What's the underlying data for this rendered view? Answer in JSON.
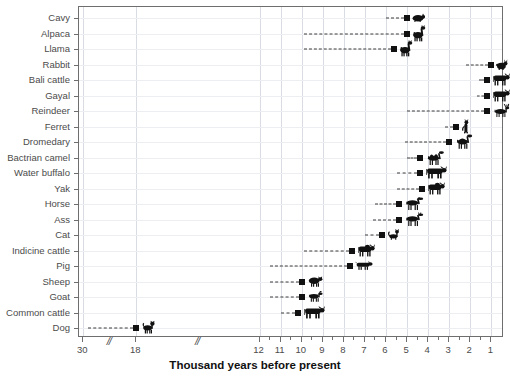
{
  "chart_data": {
    "type": "scatter",
    "title": "",
    "xlabel": "Thousand years before present",
    "ylabel": "",
    "grid": true,
    "legend": "none",
    "orientation": "horizontal",
    "marker": "square",
    "leader_line": "dashed",
    "axis_breaks": [
      "between 30 and 18",
      "between 18 and 12"
    ],
    "xticks": [
      30,
      18,
      12,
      11,
      10,
      9,
      8,
      7,
      6,
      5,
      4,
      3,
      2,
      1
    ],
    "xtick_labels": [
      "30",
      "18",
      "12",
      "11",
      "10",
      "9",
      "8",
      "7",
      "6",
      "5",
      "4",
      "3",
      "2",
      "1"
    ],
    "xlim": [
      30,
      0.6
    ],
    "categories": [
      "Cavy",
      "Alpaca",
      "Llama",
      "Rabbit",
      "Bali cattle",
      "Gayal",
      "Reindeer",
      "Ferret",
      "Dromedary",
      "Bactrian camel",
      "Water buffalo",
      "Yak",
      "Horse",
      "Ass",
      "Cat",
      "Indicine cattle",
      "Pig",
      "Sheep",
      "Goat",
      "Common cattle",
      "Dog"
    ],
    "points": [
      {
        "label": "Cavy",
        "value": 5.0,
        "icon": "cavy-silhouette"
      },
      {
        "label": "Alpaca",
        "value": 5.0,
        "icon": "alpaca-silhouette"
      },
      {
        "label": "Llama",
        "value": 5.6,
        "icon": "llama-silhouette"
      },
      {
        "label": "Rabbit",
        "value": 1.0,
        "icon": "rabbit-silhouette"
      },
      {
        "label": "Bali cattle",
        "value": 1.2,
        "icon": "bali-cattle-silhouette"
      },
      {
        "label": "Gayal",
        "value": 1.2,
        "icon": "gayal-silhouette"
      },
      {
        "label": "Reindeer",
        "value": 1.2,
        "icon": "reindeer-silhouette"
      },
      {
        "label": "Ferret",
        "value": 2.7,
        "icon": "ferret-silhouette"
      },
      {
        "label": "Dromedary",
        "value": 3.0,
        "icon": "dromedary-silhouette"
      },
      {
        "label": "Bactrian camel",
        "value": 4.4,
        "icon": "bactrian-camel-silhouette"
      },
      {
        "label": "Water buffalo",
        "value": 4.4,
        "icon": "water-buffalo-silhouette"
      },
      {
        "label": "Yak",
        "value": 4.3,
        "icon": "yak-silhouette"
      },
      {
        "label": "Horse",
        "value": 5.4,
        "icon": "horse-silhouette"
      },
      {
        "label": "Ass",
        "value": 5.4,
        "icon": "ass-silhouette"
      },
      {
        "label": "Cat",
        "value": 6.2,
        "icon": "cat-silhouette"
      },
      {
        "label": "Indicine cattle",
        "value": 7.6,
        "icon": "indicine-cattle-silhouette"
      },
      {
        "label": "Pig",
        "value": 7.7,
        "icon": "pig-silhouette"
      },
      {
        "label": "Sheep",
        "value": 10.0,
        "icon": "sheep-silhouette"
      },
      {
        "label": "Goat",
        "value": 10.0,
        "icon": "goat-silhouette"
      },
      {
        "label": "Common cattle",
        "value": 10.2,
        "icon": "common-cattle-silhouette"
      },
      {
        "label": "Dog",
        "value": 18.0,
        "icon": "dog-silhouette"
      }
    ],
    "leader_starts": [
      {
        "label": "Cavy",
        "value": 6.0
      },
      {
        "label": "Alpaca",
        "value": 9.9
      },
      {
        "label": "Llama",
        "value": 9.9
      },
      {
        "label": "Rabbit",
        "value": 2.2
      },
      {
        "label": "Bali cattle",
        "value": 1.6
      },
      {
        "label": "Gayal",
        "value": 1.7
      },
      {
        "label": "Reindeer",
        "value": 5.0
      },
      {
        "label": "Ferret",
        "value": 3.2
      },
      {
        "label": "Dromedary",
        "value": 5.1
      },
      {
        "label": "Bactrian camel",
        "value": 5.0
      },
      {
        "label": "Water buffalo",
        "value": 5.5
      },
      {
        "label": "Yak",
        "value": 5.5
      },
      {
        "label": "Horse",
        "value": 6.5
      },
      {
        "label": "Ass",
        "value": 6.6
      },
      {
        "label": "Cat",
        "value": 7.0
      },
      {
        "label": "Indicine cattle",
        "value": 9.9
      },
      {
        "label": "Pig",
        "value": 11.5
      },
      {
        "label": "Sheep",
        "value": 11.5
      },
      {
        "label": "Goat",
        "value": 11.5
      },
      {
        "label": "Common cattle",
        "value": 11.0
      },
      {
        "label": "Dog",
        "value": 29.0
      }
    ]
  },
  "axis": {
    "x_title": "Thousand years before present"
  }
}
